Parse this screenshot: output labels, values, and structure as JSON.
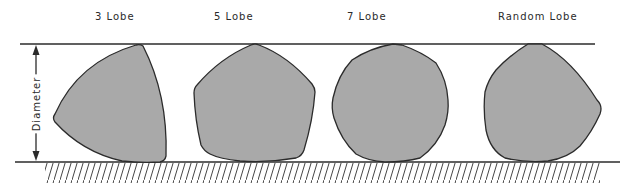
{
  "figure": {
    "labels": {
      "lobe3": "3 Lobe",
      "lobe5": "5 Lobe",
      "lobe7": "7 Lobe",
      "random": "Random Lobe"
    },
    "dimension_label": "Diameter"
  },
  "colors": {
    "shape_fill": "#a9a9a9",
    "outline": "#2b2b2b",
    "background": "#ffffff"
  }
}
